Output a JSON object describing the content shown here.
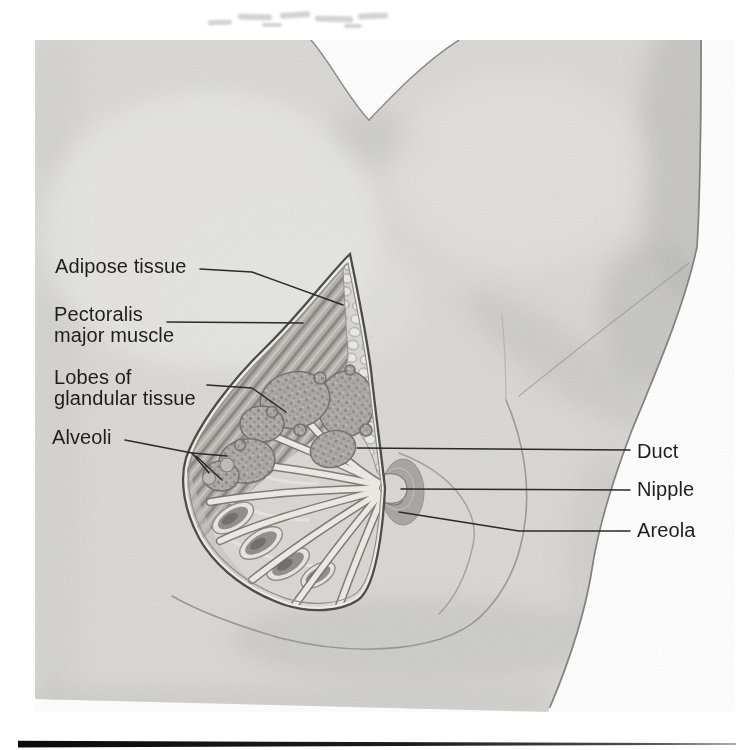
{
  "figure": {
    "labels": {
      "adipose": "Adipose tissue",
      "pectoralis": "Pectoralis\nmajor muscle",
      "lobes": "Lobes of\nglandular tissue",
      "alveoli": "Alveoli",
      "duct": "Duct",
      "nipple": "Nipple",
      "areola": "Areola"
    }
  },
  "palette": {
    "page-bg": "#ffffff",
    "body-gray": "#d9d8d5",
    "label-color": "#1e1e1e",
    "leader-color": "#2a2a2a",
    "rule-color": "#0d0d0d"
  }
}
